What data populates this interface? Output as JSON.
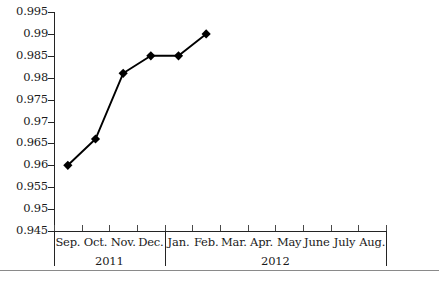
{
  "chart_data": {
    "type": "line",
    "title": "",
    "subtitle": "",
    "xlabel": "",
    "ylabel": "",
    "grid": false,
    "legend": false,
    "legend_position": "none",
    "marker": "diamond",
    "line_color": "#000000",
    "marker_color": "#000000",
    "axis_color": "#242424",
    "background": "#ffffff",
    "ylim": [
      0.945,
      0.995
    ],
    "ytick_step": 0.005,
    "ytick_labels": [
      "0.995",
      "0.99",
      "0.985",
      "0.98",
      "0.975",
      "0.97",
      "0.965",
      "0.96",
      "0.955",
      "0.95",
      "0.945"
    ],
    "ytick_values": [
      0.995,
      0.99,
      0.985,
      0.98,
      0.975,
      0.97,
      0.965,
      0.96,
      0.955,
      0.95,
      0.945
    ],
    "categories": [
      "Sep.",
      "Oct.",
      "Nov.",
      "Dec.",
      "Jan.",
      "Feb.",
      "Mar.",
      "Apr.",
      "May",
      "June",
      "July",
      "Aug."
    ],
    "values": [
      0.96,
      0.966,
      0.981,
      0.985,
      0.985,
      0.99,
      null,
      null,
      null,
      null,
      null,
      null
    ],
    "year_bands": [
      {
        "label": "2011",
        "start_index": 0,
        "end_index": 3
      },
      {
        "label": "2012",
        "start_index": 4,
        "end_index": 11
      }
    ],
    "points": [
      {
        "category": "Sep.",
        "year": "2011",
        "value": 0.96
      },
      {
        "category": "Oct.",
        "year": "2011",
        "value": 0.966
      },
      {
        "category": "Nov.",
        "year": "2011",
        "value": 0.981
      },
      {
        "category": "Dec.",
        "year": "2011",
        "value": 0.985
      },
      {
        "category": "Jan.",
        "year": "2012",
        "value": 0.985
      },
      {
        "category": "Feb.",
        "year": "2012",
        "value": 0.99
      }
    ]
  }
}
